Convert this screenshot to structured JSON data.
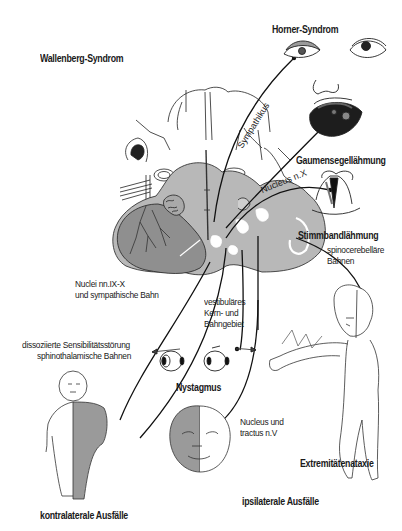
{
  "title": "Wallenberg-Syndrom",
  "groups": {
    "contralateral": "kontralaterale Ausfälle",
    "ipsilateral": "ipsilaterale Ausfälle"
  },
  "symptoms": {
    "horner": "Horner-Syndrom",
    "gaumensegel": "Gaumensegellähmung",
    "stimmband": "Stimmbandlähmung",
    "nystagmus": "Nystagmus",
    "extremitaeten": "Extremitätenataxie"
  },
  "pathways": {
    "sympathikus": "Sympathikus",
    "nucleus_x": "Nucleus n.X",
    "spinocerebellar_line1": "spinocerebelläre",
    "spinocerebellar_line2": "Bahnen",
    "nuclei_ix_x_line1": "Nuclei nn.IX-X",
    "nuclei_ix_x_line2": "und sympathische Bahn",
    "vestibular_line1": "vestibuläres",
    "vestibular_line2": "Kern- und",
    "vestibular_line3": "Bahngebiet",
    "dissoziiert_line1": "dissoziierte Sensibilitätsstörung",
    "dissoziiert_line2": "sphinothalamische Bahnen",
    "trigeminus_line1": "Nucleus und",
    "trigeminus_line2": "tractus n.V"
  },
  "colors": {
    "lesion_gray": "#9a9a9a",
    "brainstem_gray": "#b8b8b8",
    "dark_gray": "#7d7d7d",
    "line": "#111111"
  }
}
